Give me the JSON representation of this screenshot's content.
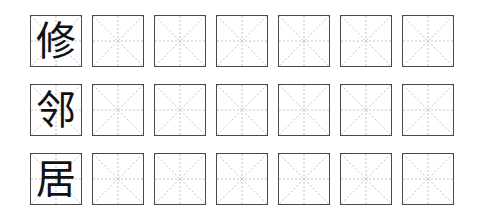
{
  "sheet": {
    "grid_type": "mi-zi-ge",
    "columns_per_row": 7,
    "rows": [
      {
        "character": "修"
      },
      {
        "character": "邻"
      },
      {
        "character": "居"
      }
    ]
  }
}
